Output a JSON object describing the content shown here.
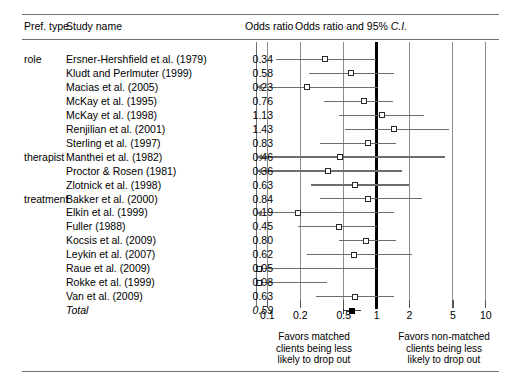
{
  "table": {
    "headers": {
      "pref_type": "Pref. type",
      "study_name": "Study name",
      "odds_ratio": "Odds ratio",
      "plot_title_main": "Odds ratio and 95% ",
      "plot_title_italic": "C.I."
    },
    "rows": [
      {
        "pref_type": "role",
        "study": "Ersner-Hershfield et al. (1979)",
        "or": "0.34",
        "or_value": 0.34,
        "ci_low": 0.12,
        "ci_high": 0.98,
        "total": false,
        "clipped_low": false
      },
      {
        "pref_type": "",
        "study": "Kludt and Perlmuter (1999)",
        "or": "0.58",
        "or_value": 0.58,
        "ci_low": 0.24,
        "ci_high": 1.45,
        "total": false,
        "clipped_low": false
      },
      {
        "pref_type": "",
        "study": "Macias et al. (2005)",
        "or": "0.23",
        "or_value": 0.23,
        "ci_low": 0.08,
        "ci_high": 1.02,
        "total": false,
        "clipped_low": true
      },
      {
        "pref_type": "",
        "study": "McKay et al. (1995)",
        "or": "0.76",
        "or_value": 0.76,
        "ci_low": 0.33,
        "ci_high": 1.42,
        "total": false,
        "clipped_low": false
      },
      {
        "pref_type": "",
        "study": "McKay et al. (1998)",
        "or": "1.13",
        "or_value": 1.13,
        "ci_low": 0.45,
        "ci_high": 2.7,
        "total": false,
        "clipped_low": false
      },
      {
        "pref_type": "",
        "study": "Renjilian et al. (2001)",
        "or": "1.43",
        "or_value": 1.43,
        "ci_low": 0.51,
        "ci_high": 4.6,
        "total": false,
        "clipped_low": false
      },
      {
        "pref_type": "",
        "study": "Sterling et al. (1997)",
        "or": "0.83",
        "or_value": 0.83,
        "ci_low": 0.3,
        "ci_high": 1.5,
        "total": false,
        "clipped_low": false
      },
      {
        "pref_type": "therapist",
        "study": "Manthei et al. (1982)",
        "or": "0.46",
        "or_value": 0.46,
        "ci_low": 0.08,
        "ci_high": 4.2,
        "total": false,
        "clipped_low": true
      },
      {
        "pref_type": "",
        "study": "Proctor & Rosen (1981)",
        "or": "0.36",
        "or_value": 0.36,
        "ci_low": 0.08,
        "ci_high": 1.7,
        "total": false,
        "clipped_low": true
      },
      {
        "pref_type": "",
        "study": "Zlotnick et al. (1998)",
        "or": "0.63",
        "or_value": 0.63,
        "ci_low": 0.25,
        "ci_high": 2.0,
        "total": false,
        "clipped_low": false
      },
      {
        "pref_type": "treatment",
        "study": "Bakker et al. (2000)",
        "or": "0.84",
        "or_value": 0.84,
        "ci_low": 0.3,
        "ci_high": 2.6,
        "total": false,
        "clipped_low": false
      },
      {
        "pref_type": "",
        "study": "Elkin et al. (1999)",
        "or": "0.19",
        "or_value": 0.19,
        "ci_low": 0.08,
        "ci_high": 1.45,
        "total": false,
        "clipped_low": true
      },
      {
        "pref_type": "",
        "study": "Fuller (1988)",
        "or": "0.45",
        "or_value": 0.45,
        "ci_low": 0.19,
        "ci_high": 1.0,
        "total": false,
        "clipped_low": false
      },
      {
        "pref_type": "",
        "study": "Kocsis et al. (2009)",
        "or": "0.80",
        "or_value": 0.8,
        "ci_low": 0.45,
        "ci_high": 1.5,
        "total": false,
        "clipped_low": false
      },
      {
        "pref_type": "",
        "study": "Leykin et al. (2007)",
        "or": "0.62",
        "or_value": 0.62,
        "ci_low": 0.23,
        "ci_high": 2.1,
        "total": false,
        "clipped_low": false
      },
      {
        "pref_type": "",
        "study": "Raue et al. (2009)",
        "or": "0.05",
        "or_value": 0.05,
        "ci_low": 0.08,
        "ci_high": 1.0,
        "total": false,
        "clipped_low": true
      },
      {
        "pref_type": "",
        "study": "Rokke et al. (1999)",
        "or": "0.08",
        "or_value": 0.08,
        "ci_low": 0.08,
        "ci_high": 0.35,
        "total": false,
        "clipped_low": true
      },
      {
        "pref_type": "",
        "study": "Van et al. (2009)",
        "or": "0.63",
        "or_value": 0.63,
        "ci_low": 0.28,
        "ci_high": 1.45,
        "total": false,
        "clipped_low": false
      },
      {
        "pref_type": "",
        "study": "Total",
        "or": "0.59",
        "or_value": 0.59,
        "ci_low": 0.5,
        "ci_high": 0.72,
        "total": true,
        "clipped_low": false
      }
    ]
  },
  "chart_data": {
    "type": "forest",
    "title": "Odds ratio and 95% C.I.",
    "xlabel": "Odds ratio",
    "xscale": "log",
    "xlim": [
      0.08,
      12.0
    ],
    "xticks": [
      "0.1",
      "0.2",
      "0.5",
      "1",
      "2",
      "5",
      "10"
    ],
    "xtick_values": [
      0.1,
      0.2,
      0.5,
      1,
      2,
      5,
      10
    ],
    "null_line": 1,
    "grid": true,
    "legend": "none",
    "studies": [
      "Ersner-Hershfield et al. (1979)",
      "Kludt and Perlmuter (1999)",
      "Macias et al. (2005)",
      "McKay et al. (1995)",
      "McKay et al. (1998)",
      "Renjilian et al. (2001)",
      "Sterling et al. (1997)",
      "Manthei et al. (1982)",
      "Proctor & Rosen (1981)",
      "Zlotnick et al. (1998)",
      "Bakker et al. (2000)",
      "Elkin et al. (1999)",
      "Fuller (1988)",
      "Kocsis et al. (2009)",
      "Leykin et al. (2007)",
      "Raue et al. (2009)",
      "Rokke et al. (1999)",
      "Van et al. (2009)",
      "Total"
    ],
    "odds_ratios": [
      0.34,
      0.58,
      0.23,
      0.76,
      1.13,
      1.43,
      0.83,
      0.46,
      0.36,
      0.63,
      0.84,
      0.19,
      0.45,
      0.8,
      0.62,
      0.05,
      0.08,
      0.63,
      0.59
    ],
    "summary_estimate": 0.59
  },
  "footer": {
    "left_caption": "Favors matched\nclients being less\nlikely to drop out",
    "right_caption": "Favors non-matched\nclients being less\nlikely to drop out"
  }
}
